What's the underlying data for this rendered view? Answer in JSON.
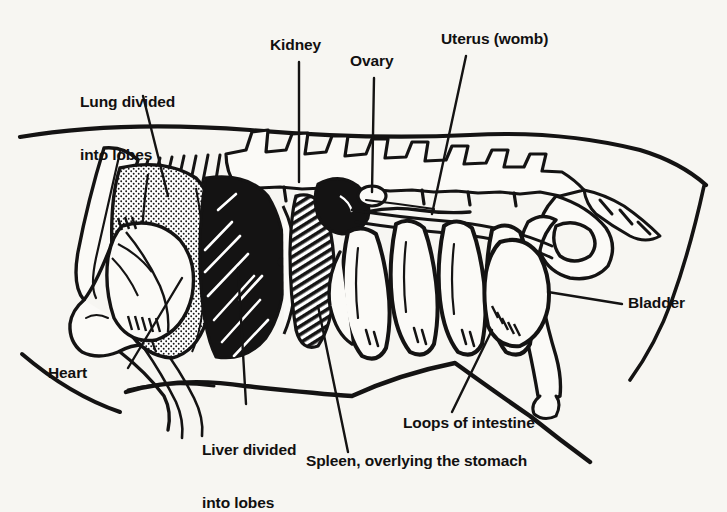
{
  "figure": {
    "view": "left lateral",
    "style": "black and white line drawing with stipple and hatch shading",
    "background_color": "#f7f6f2",
    "ink_color": "#141313"
  },
  "labels": [
    {
      "id": "lung",
      "text": "Lung divided\ninto lobes",
      "line1": "Lung divided",
      "line2": "into lobes",
      "x": 80,
      "y": 58,
      "align": "left",
      "leader": "down-right to stippled lung in chest"
    },
    {
      "id": "kidney",
      "text": "Kidney",
      "line1": "Kidney",
      "line2": "",
      "x": 270,
      "y": 36,
      "align": "left",
      "leader": "vertical down to dark kidney"
    },
    {
      "id": "ovary",
      "text": "Ovary",
      "line1": "Ovary",
      "line2": "",
      "x": 350,
      "y": 52,
      "align": "left",
      "leader": "vertical down to small oval ovary"
    },
    {
      "id": "uterus",
      "text": "Uterus (womb)",
      "line1": "Uterus (womb)",
      "line2": "",
      "x": 441,
      "y": 30,
      "align": "left",
      "leader": "down-left to uterine horn"
    },
    {
      "id": "bladder",
      "text": "Bladder",
      "line1": "Bladder",
      "line2": "",
      "x": 628,
      "y": 300,
      "align": "left",
      "leader": "horizontal left to bladder"
    },
    {
      "id": "heart",
      "text": "Heart",
      "line1": "Heart",
      "line2": "",
      "x": 48,
      "y": 371,
      "align": "left",
      "leader": "up-right to heart inside chest"
    },
    {
      "id": "liver",
      "text": "Liver divided\ninto lobes",
      "line1": "Liver divided",
      "line2": "into lobes",
      "x": 202,
      "y": 411,
      "align": "left",
      "leader": "vertical up to solid black liver"
    },
    {
      "id": "intestine",
      "text": "Loops of intestine",
      "line1": "Loops of intestine",
      "line2": "",
      "x": 403,
      "y": 419,
      "align": "left",
      "leader": "up-right to coiled intestines"
    },
    {
      "id": "spleen",
      "text": "Spleen, overlying the stomach",
      "line1": "Spleen, overlying the stomach",
      "line2": "",
      "x": 306,
      "y": 459,
      "align": "left",
      "leader": "up-left to hatched spleen"
    }
  ],
  "organs": [
    {
      "name": "lung",
      "shading": "stipple",
      "description": "large pale stippled lobed lung filling the chest"
    },
    {
      "name": "heart",
      "shading": "outline",
      "description": "heart outline with vessels inside the lung region"
    },
    {
      "name": "liver",
      "shading": "solid-black",
      "description": "solid black liver with white hatch strokes, divided into lobes"
    },
    {
      "name": "spleen",
      "shading": "diagonal-hatch",
      "description": "elongated hatched spleen overlying the stomach"
    },
    {
      "name": "kidney",
      "shading": "solid-black",
      "description": "dark bean shaped kidney high under the spine"
    },
    {
      "name": "ovary",
      "shading": "white-oval",
      "description": "small white oval just below the spine"
    },
    {
      "name": "uterus",
      "shading": "thin-outline",
      "description": "slender uterine horns running back toward the pelvis"
    },
    {
      "name": "intestine",
      "shading": "stipple-edge",
      "description": "coiled loops of small intestine filling the abdomen"
    },
    {
      "name": "bladder",
      "shading": "outline",
      "description": "pear shaped bladder in front of the pelvis"
    }
  ],
  "skeleton": [
    {
      "name": "spine",
      "description": "thoracic and lumbar vertebrae with tall spinous processes"
    },
    {
      "name": "ribs",
      "description": "slanting ribs over the chest"
    },
    {
      "name": "scapula",
      "description": "shoulder blade at front"
    },
    {
      "name": "humerus",
      "description": "upper foreleg bone and elbow"
    },
    {
      "name": "pelvis",
      "description": "pelvic girdle at rear"
    },
    {
      "name": "femur",
      "description": "thigh bone with stifle joint"
    },
    {
      "name": "sternum",
      "description": "breastbone along the chest floor"
    }
  ]
}
